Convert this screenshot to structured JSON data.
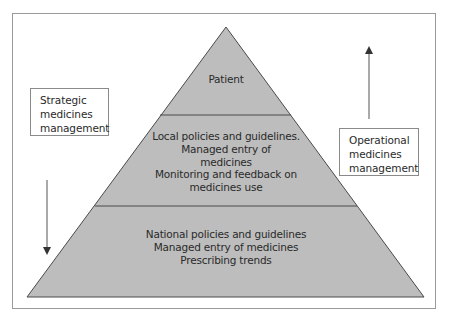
{
  "diagram": {
    "type": "pyramid",
    "tiers": [
      {
        "id": "top",
        "lines": [
          "Patient"
        ]
      },
      {
        "id": "middle",
        "lines": [
          "Local policies and guidelines.",
          "Managed entry of",
          "medicines",
          "Monitoring and feedback on",
          "medicines use"
        ]
      },
      {
        "id": "bottom",
        "lines": [
          "National policies and guidelines",
          "Managed entry of medicines",
          "Prescribing trends"
        ]
      }
    ],
    "left_label": {
      "lines": [
        "Strategic",
        "medicines",
        "management"
      ],
      "arrow": "down"
    },
    "right_label": {
      "lines": [
        "Operational",
        "medicines",
        "management"
      ],
      "arrow": "up"
    },
    "colors": {
      "pyramid_fill": "#bdbdbd",
      "pyramid_stroke": "#4a4a4a",
      "frame": "#9a9a9a",
      "arrow": "#555555",
      "text": "#2a2a2a"
    }
  }
}
